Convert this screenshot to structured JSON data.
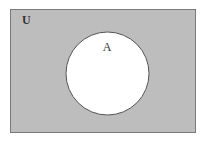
{
  "diagram": {
    "type": "venn",
    "universe": {
      "label": "U",
      "fill": "#bdbdbd",
      "stroke": "#7a7a7a"
    },
    "sets": [
      {
        "label": "A",
        "fill": "#ffffff",
        "stroke": "#555555"
      }
    ]
  }
}
